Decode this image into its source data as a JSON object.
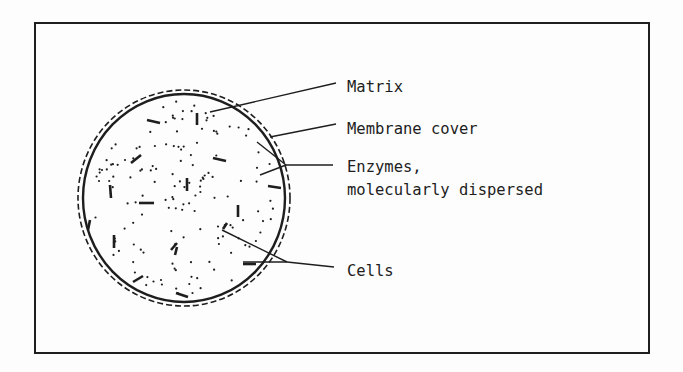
{
  "diagram": {
    "type": "schematic",
    "colors": {
      "ink": "#1e1e1e",
      "background": "#fdfdfd"
    },
    "labels": [
      {
        "id": "matrix",
        "lines": [
          "Matrix"
        ]
      },
      {
        "id": "membrane",
        "lines": [
          "Membrane cover"
        ]
      },
      {
        "id": "enzymes",
        "lines": [
          "Enzymes,",
          "molecularly dispersed"
        ]
      },
      {
        "id": "cells",
        "lines": [
          "Cells"
        ]
      }
    ]
  }
}
